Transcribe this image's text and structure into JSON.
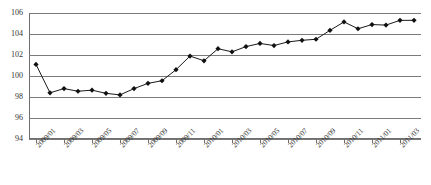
{
  "chart_data": {
    "type": "line",
    "title": "",
    "xlabel": "",
    "ylabel": "",
    "ylim": [
      94,
      106
    ],
    "yticks": [
      94,
      96,
      98,
      100,
      102,
      104,
      106
    ],
    "grid": true,
    "legend": "none",
    "marker": "diamond",
    "line_color": "#1a1a1a",
    "marker_color": "#111111",
    "grid_color": "#7a7a7a",
    "categories": [
      "2009/01",
      "2009/02",
      "2009/03",
      "2009/04",
      "2009/05",
      "2009/06",
      "2009/07",
      "2009/08",
      "2009/09",
      "2009/10",
      "2009/11",
      "2009/12",
      "2010/01",
      "2010/02",
      "2010/03",
      "2010/04",
      "2010/05",
      "2010/06",
      "2010/07",
      "2010/08",
      "2010/09",
      "2010/10",
      "2010/11",
      "2010/12",
      "2011/01",
      "2011/02",
      "2011/03",
      "2011/04"
    ],
    "tick_labels": [
      "2009/01",
      "2009/03",
      "2009/05",
      "2009/07",
      "2009/09",
      "2009/11",
      "2010/01",
      "2010/03",
      "2010/05",
      "2010/07",
      "2010/09",
      "2010/11",
      "2011/01",
      "2011/03"
    ],
    "values": [
      101.1,
      98.4,
      98.8,
      98.55,
      98.65,
      98.35,
      98.2,
      98.8,
      99.3,
      99.55,
      100.6,
      101.9,
      101.45,
      102.6,
      102.3,
      102.8,
      103.1,
      102.9,
      103.25,
      103.4,
      103.5,
      104.35,
      105.15,
      104.5,
      104.9,
      104.85,
      105.3,
      105.3
    ]
  }
}
